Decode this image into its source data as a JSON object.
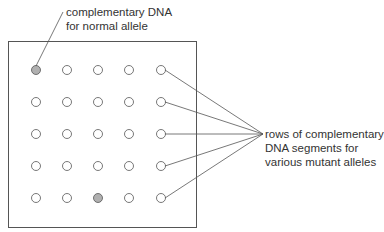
{
  "labels": {
    "normal": [
      "complementary DNA",
      "for normal allele"
    ],
    "mutant": [
      "rows of complementary",
      "DNA segments for",
      "various mutant alleles"
    ]
  },
  "grid": {
    "rows": 5,
    "cols": 5,
    "filled": [
      [
        0,
        0
      ],
      [
        4,
        2
      ]
    ],
    "colors": {
      "filled": "#b0b0b0",
      "stroke": "#555555",
      "empty": "#ffffff"
    }
  }
}
